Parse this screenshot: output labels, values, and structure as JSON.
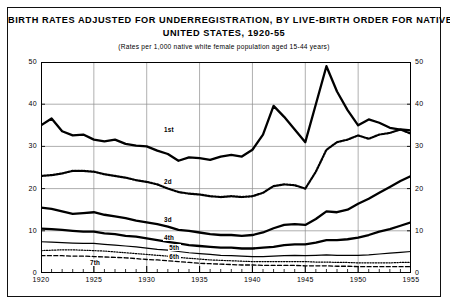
{
  "title": {
    "line1": "BIRTH RATES ADJUSTED FOR UNDERREGISTRATION, BY LIVE-BIRTH ORDER FOR NATIVE WHITE WOMEN:",
    "line2": "UNITED STATES, 1920-55",
    "subtitle": "(Rates per 1,000 native white female population aged 15-44 years)"
  },
  "chart_data": {
    "type": "line",
    "title": "BIRTH RATES ADJUSTED FOR UNDERREGISTRATION, BY LIVE-BIRTH ORDER FOR NATIVE WHITE WOMEN: UNITED STATES, 1920-55",
    "subtitle": "(Rates per 1,000 native white female population aged 15-44 years)",
    "xlabel": "",
    "ylabel": "",
    "xlim": [
      1920,
      1955
    ],
    "ylim": [
      0,
      50
    ],
    "yticks": [
      0,
      10,
      20,
      30,
      40,
      50
    ],
    "xticks": [
      1920,
      1925,
      1930,
      1935,
      1940,
      1945,
      1950,
      1955
    ],
    "grid": "horizontal",
    "legend": "inline-labels",
    "x": [
      1920,
      1921,
      1922,
      1923,
      1924,
      1925,
      1926,
      1927,
      1928,
      1929,
      1930,
      1931,
      1932,
      1933,
      1934,
      1935,
      1936,
      1937,
      1938,
      1939,
      1940,
      1941,
      1942,
      1943,
      1944,
      1945,
      1946,
      1947,
      1948,
      1949,
      1950,
      1951,
      1952,
      1953,
      1954,
      1955
    ],
    "series": [
      {
        "name": "1st",
        "label": "1st",
        "style": "solid-thick",
        "values": [
          35.0,
          36.6,
          33.6,
          32.6,
          32.8,
          31.6,
          31.2,
          31.6,
          30.6,
          30.2,
          30.0,
          29.0,
          28.2,
          26.6,
          27.4,
          27.2,
          26.8,
          27.6,
          28.0,
          27.6,
          29.2,
          32.8,
          39.6,
          37.0,
          34.0,
          31.0,
          40.0,
          49.0,
          43.0,
          38.6,
          35.0,
          36.4,
          35.6,
          34.4,
          34.0,
          33.8
        ]
      },
      {
        "name": "2d",
        "label": "2d",
        "style": "dotted-thick",
        "values": [
          23.0,
          23.2,
          23.6,
          24.2,
          24.2,
          24.0,
          23.4,
          23.0,
          22.6,
          22.0,
          21.6,
          21.0,
          20.0,
          19.2,
          18.8,
          18.6,
          18.2,
          18.0,
          18.2,
          18.0,
          18.2,
          19.0,
          20.6,
          21.0,
          20.8,
          20.0,
          24.0,
          29.2,
          31.0,
          31.6,
          32.6,
          31.8,
          32.8,
          33.2,
          34.0,
          33.0
        ]
      },
      {
        "name": "3d",
        "label": "3d",
        "style": "solid-thick",
        "values": [
          15.5,
          15.2,
          14.6,
          14.0,
          14.2,
          14.4,
          13.8,
          13.4,
          13.0,
          12.4,
          12.0,
          11.6,
          11.0,
          10.2,
          10.0,
          9.6,
          9.2,
          9.0,
          9.0,
          8.8,
          9.0,
          9.6,
          10.6,
          11.4,
          11.6,
          11.4,
          12.8,
          14.6,
          14.4,
          15.0,
          16.4,
          17.6,
          19.0,
          20.4,
          21.8,
          23.0
        ]
      },
      {
        "name": "4th",
        "label": "4th",
        "style": "solid-thick",
        "values": [
          10.5,
          10.4,
          10.2,
          10.0,
          9.8,
          9.8,
          9.4,
          9.2,
          8.8,
          8.6,
          8.2,
          7.8,
          7.4,
          7.0,
          6.6,
          6.4,
          6.2,
          6.0,
          6.0,
          5.8,
          5.8,
          6.0,
          6.2,
          6.6,
          6.8,
          6.8,
          7.2,
          7.8,
          7.8,
          8.0,
          8.4,
          9.0,
          9.8,
          10.4,
          11.2,
          12.0
        ]
      },
      {
        "name": "5th",
        "label": "5th",
        "style": "solid-thin",
        "values": [
          7.4,
          7.3,
          7.2,
          7.1,
          7.0,
          7.0,
          6.8,
          6.6,
          6.4,
          6.2,
          5.9,
          5.6,
          5.4,
          5.1,
          4.8,
          4.6,
          4.4,
          4.2,
          4.1,
          4.0,
          3.9,
          3.9,
          4.0,
          4.1,
          4.2,
          4.1,
          4.2,
          4.3,
          4.2,
          4.2,
          4.2,
          4.3,
          4.5,
          4.7,
          4.9,
          5.1
        ]
      },
      {
        "name": "6th",
        "label": "6th",
        "style": "dotted-thin",
        "values": [
          5.3,
          5.4,
          5.5,
          5.5,
          5.4,
          5.3,
          5.2,
          5.0,
          4.8,
          4.6,
          4.4,
          4.2,
          4.0,
          3.7,
          3.5,
          3.3,
          3.1,
          3.0,
          2.9,
          2.8,
          2.7,
          2.7,
          2.7,
          2.7,
          2.7,
          2.7,
          2.6,
          2.6,
          2.5,
          2.5,
          2.4,
          2.4,
          2.4,
          2.4,
          2.5,
          2.5
        ]
      },
      {
        "name": "7th",
        "label": "7th",
        "style": "dashed",
        "values": [
          4.1,
          4.1,
          4.1,
          4.0,
          4.0,
          3.9,
          3.8,
          3.7,
          3.6,
          3.4,
          3.2,
          3.1,
          2.9,
          2.7,
          2.5,
          2.3,
          2.2,
          2.1,
          2.0,
          1.9,
          1.9,
          1.8,
          1.8,
          1.8,
          1.8,
          1.7,
          1.7,
          1.7,
          1.6,
          1.6,
          1.5,
          1.5,
          1.5,
          1.5,
          1.5,
          1.5
        ]
      }
    ],
    "series_label_positions": [
      {
        "name": "1st",
        "x": 1931.5,
        "y": 34.0
      },
      {
        "name": "2d",
        "x": 1931.5,
        "y": 21.6
      },
      {
        "name": "3d",
        "x": 1931.5,
        "y": 12.6
      },
      {
        "name": "4th",
        "x": 1931.5,
        "y": 8.3
      },
      {
        "name": "5th",
        "x": 1932.0,
        "y": 6.0
      },
      {
        "name": "6th",
        "x": 1932.0,
        "y": 3.9
      },
      {
        "name": "7th",
        "x": 1924.5,
        "y": 2.4
      }
    ]
  },
  "colors": {
    "ink": "#000000",
    "grid": "#8c8c8c",
    "background": "#ffffff"
  }
}
